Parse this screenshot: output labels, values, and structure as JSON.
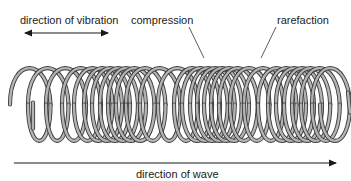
{
  "diagram": {
    "labels": {
      "direction_of_vibration": "direction of vibration",
      "compression": "compression",
      "rarefaction": "rarefaction",
      "direction_of_wave": "direction of wave"
    },
    "arrows": {
      "vibration": {
        "type": "double-headed",
        "orientation": "horizontal"
      },
      "wave": {
        "type": "single-headed",
        "direction": "right"
      }
    },
    "colors": {
      "coil_fill": "#b4b4b4",
      "coil_outline": "#3a3a3a",
      "text": "#1a1a1a",
      "arrow": "#1a1a1a"
    },
    "spring": {
      "loop_centers_x": [
        28,
        46,
        64,
        80,
        92,
        102,
        110,
        118,
        126,
        134,
        144,
        158,
        176,
        192,
        200,
        208,
        215,
        222,
        229,
        237,
        248,
        262,
        276,
        286,
        294,
        302,
        310,
        319,
        330
      ],
      "top_y": 60,
      "bottom_y": 149,
      "loop_half_width": 18
    }
  }
}
